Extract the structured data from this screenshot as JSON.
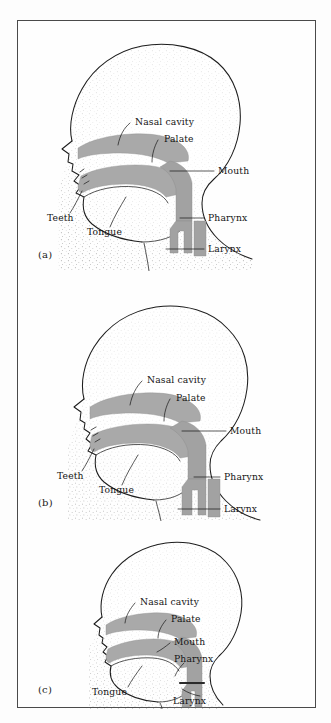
{
  "figure": {
    "kind": "anatomical-diagram",
    "colors": {
      "page_background": "#fdfdfd",
      "frame_border": "#4a4a4a",
      "tract_fill": "#a9a9a9",
      "outline_stroke": "#1d1d1d",
      "label_text": "#141414",
      "stipple_dot": "#5a5a5a"
    },
    "panels": [
      {
        "id": "a",
        "caption": "(a)",
        "labels": [
          {
            "name": "nasal-cavity",
            "text": "Nasal cavity"
          },
          {
            "name": "palate",
            "text": "Palate"
          },
          {
            "name": "mouth",
            "text": "Mouth"
          },
          {
            "name": "teeth",
            "text": "Teeth"
          },
          {
            "name": "tongue",
            "text": "Tongue"
          },
          {
            "name": "pharynx",
            "text": "Pharynx"
          },
          {
            "name": "larynx",
            "text": "Larynx"
          }
        ]
      },
      {
        "id": "b",
        "caption": "(b)",
        "labels": [
          {
            "name": "nasal-cavity",
            "text": "Nasal cavity"
          },
          {
            "name": "palate",
            "text": "Palate"
          },
          {
            "name": "mouth",
            "text": "Mouth"
          },
          {
            "name": "teeth",
            "text": "Teeth"
          },
          {
            "name": "tongue",
            "text": "Tongue"
          },
          {
            "name": "pharynx",
            "text": "Pharynx"
          },
          {
            "name": "larynx",
            "text": "Larynx"
          }
        ]
      },
      {
        "id": "c",
        "caption": "(c)",
        "labels": [
          {
            "name": "nasal-cavity",
            "text": "Nasal cavity"
          },
          {
            "name": "palate",
            "text": "Palate"
          },
          {
            "name": "mouth",
            "text": "Mouth"
          },
          {
            "name": "pharynx",
            "text": "Pharynx"
          },
          {
            "name": "tongue",
            "text": "Tongue"
          },
          {
            "name": "larynx",
            "text": "Larynx"
          }
        ]
      }
    ]
  }
}
